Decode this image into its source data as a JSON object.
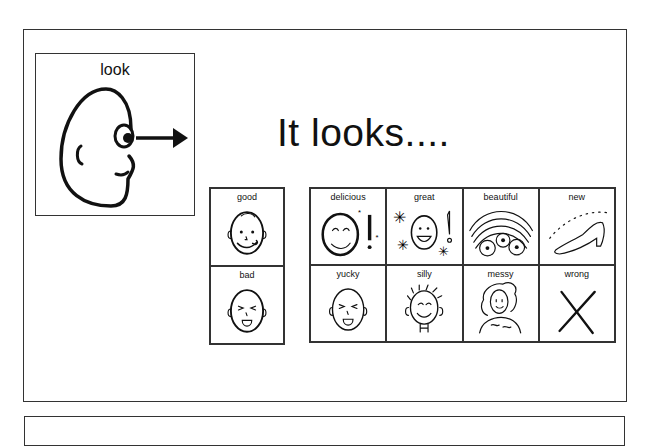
{
  "worksheet": {
    "title": "It looks....",
    "look_card": {
      "label": "look",
      "icon": "face-looking-arrow-icon"
    },
    "good_bad_column": [
      {
        "label": "good",
        "icon": "face-licking-lips-icon"
      },
      {
        "label": "bad",
        "icon": "face-tongue-out-disgust-icon"
      }
    ],
    "adjective_grid": [
      {
        "label": "delicious",
        "icon": "face-yummy-exclaim-icon"
      },
      {
        "label": "great",
        "icon": "smiley-stars-exclaim-icon"
      },
      {
        "label": "beautiful",
        "icon": "rainbow-flowers-icon"
      },
      {
        "label": "new",
        "icon": "sparkling-shoe-icon"
      },
      {
        "label": "yucky",
        "icon": "face-yucky-icon"
      },
      {
        "label": "silly",
        "icon": "face-silly-hair-icon"
      },
      {
        "label": "messy",
        "icon": "messy-hair-person-icon"
      },
      {
        "label": "wrong",
        "icon": "cross-x-icon"
      }
    ],
    "colors": {
      "line": "#333333",
      "background": "#ffffff",
      "text": "#111111"
    }
  }
}
